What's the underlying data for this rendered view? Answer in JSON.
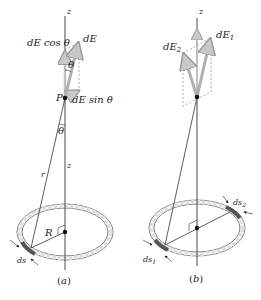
{
  "panels": [
    {
      "id": "a",
      "caption": "(a)",
      "axis_label_top": "z",
      "axis_label_bottom": "z",
      "point_label": "P",
      "vector_label": "dE",
      "component_vertical": "dE cos θ",
      "component_horizontal": "dE sin θ",
      "angle_label_top": "θ",
      "angle_label_bottom": "θ",
      "distance_label": "r",
      "radius_label": "R",
      "element_label": "ds"
    },
    {
      "id": "b",
      "caption": "(b)",
      "axis_label_top": "z",
      "vector1_label": "dE",
      "vector1_sub": "1",
      "vector2_label": "dE",
      "vector2_sub": "2",
      "element1_label": "ds",
      "element1_sub": "1",
      "element2_label": "ds",
      "element2_sub": "2"
    }
  ],
  "colors": {
    "vector": "#b8b8b8",
    "ring_fill": "#e6e6e6",
    "ring_stroke": "#7a7a7a",
    "axis": "#333333",
    "dashed": "#888888"
  }
}
